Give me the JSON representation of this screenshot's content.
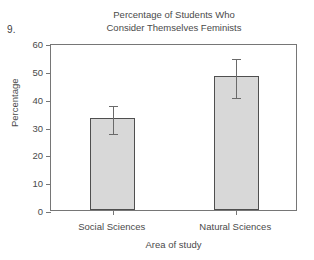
{
  "question_number": "9.",
  "chart_data": {
    "type": "bar",
    "title": "Percentage of Students Who Consider Themselves Feminists",
    "title_lines": [
      "Percentage of Students Who",
      "Consider Themselves Feminists"
    ],
    "xlabel": "Area of study",
    "ylabel": "Percentage",
    "categories": [
      "Social Sciences",
      "Natural Sciences"
    ],
    "values": [
      33,
      48
    ],
    "errors": [
      5,
      7
    ],
    "error_low": [
      28,
      41
    ],
    "error_high": [
      38,
      55
    ],
    "ylim": [
      0,
      60
    ],
    "ytick_labels": [
      "0",
      "10",
      "20",
      "30",
      "40",
      "50",
      "60"
    ],
    "ytick_values": [
      0,
      10,
      20,
      30,
      40,
      50,
      60
    ],
    "grid": false,
    "legend": "none",
    "bar_fill_color": "#d8d8d8",
    "bar_border_color": "#4f4f4f",
    "axis_color": "#767676",
    "error_bar_color": "#6a6a6a"
  }
}
